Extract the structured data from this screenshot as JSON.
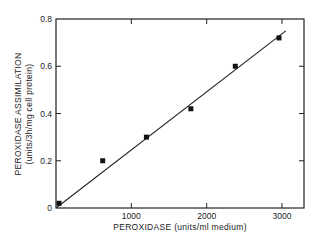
{
  "chart_data": {
    "type": "scatter",
    "title": "",
    "xlabel": "PEROXIDASE (units/ml medium)",
    "ylabel_line1": "PEROXIDASE ASSIMILATION",
    "ylabel_line2": "(units/3h/mg cell protein)",
    "xlim": [
      0,
      3250
    ],
    "ylim": [
      0,
      0.8
    ],
    "x_ticks": [
      1000,
      2000,
      3000
    ],
    "x_tick_labels": [
      "1000",
      "2000",
      "3000"
    ],
    "y_ticks": [
      0,
      0.2,
      0.4,
      0.6,
      0.8
    ],
    "y_tick_labels": [
      "0",
      "0.2",
      "0.4",
      "0.6",
      "0.8"
    ],
    "grid": false,
    "legend": null,
    "series": [
      {
        "name": "measured",
        "marker": "square",
        "x": [
          40,
          620,
          1200,
          1790,
          2380,
          2960
        ],
        "y": [
          0.02,
          0.2,
          0.3,
          0.42,
          0.6,
          0.72
        ]
      },
      {
        "name": "fit",
        "style": "line",
        "x": [
          0,
          3050
        ],
        "y": [
          0.0,
          0.75
        ]
      }
    ]
  }
}
